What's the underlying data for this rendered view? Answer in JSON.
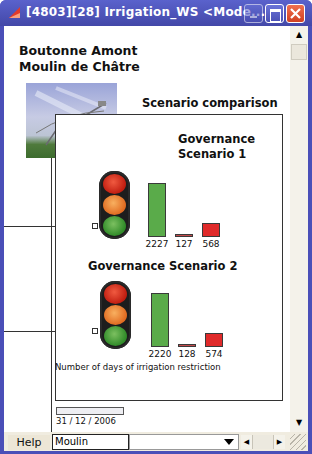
{
  "window": {
    "title": "[4803][28]  Irrigation_WS    <Mode...",
    "controls": [
      "minimize",
      "maximize",
      "close"
    ]
  },
  "main": {
    "heading_line1": "Boutonne Amont",
    "heading_line2": "Moulin de Châtre",
    "section_title": "Scenario comparison",
    "caption": "Number of days of irrigation restriction"
  },
  "scenarios": [
    {
      "title_line1": "Governance",
      "title_line2": "Scenario 1",
      "values": [
        "2227",
        "127",
        "568"
      ]
    },
    {
      "title": "Governance Scenario 2",
      "values": [
        "2220",
        "128",
        "574"
      ]
    }
  ],
  "colors": {
    "window_frame": "#4a4fb8",
    "bar_green": "#5aab4a",
    "bar_red": "#e02a2a",
    "bar_brown": "#c24a4a"
  },
  "progress": {
    "date": "31 / 12 / 2006"
  },
  "statusbar": {
    "help_label": "Help",
    "name_value": "Moulin",
    "combo_value": ""
  }
}
